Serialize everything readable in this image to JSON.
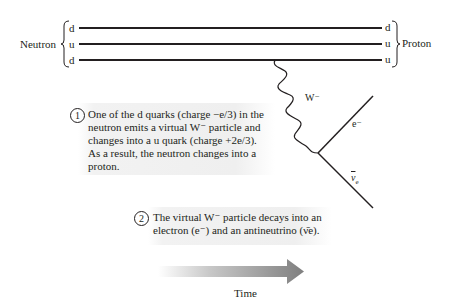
{
  "neutron": {
    "label": "Neutron",
    "quarks": [
      "d",
      "u",
      "d"
    ]
  },
  "proton": {
    "label": "Proton",
    "quarks": [
      "d",
      "u",
      "u"
    ]
  },
  "boson": {
    "label": "W⁻"
  },
  "products": {
    "electron_label": "e⁻",
    "antineutrino_label": "ν̄e"
  },
  "step1": {
    "number": "1",
    "lines": [
      "One of the d quarks (charge −e/3) in the",
      "neutron emits a virtual W⁻ particle and",
      "changes into a u quark (charge +2e/3).",
      "As a result, the neutron changes into a",
      "proton."
    ]
  },
  "step2": {
    "number": "2",
    "lines": [
      "The virtual W⁻ particle decays into an",
      "electron (e⁻) and an antineutrino (ν̄e)."
    ]
  },
  "time_axis": {
    "label": "Time"
  },
  "colors": {
    "line": "#231f20",
    "box": "#efefef",
    "arrow_start": "#ffffff",
    "arrow_end": "#8a8a8a"
  }
}
